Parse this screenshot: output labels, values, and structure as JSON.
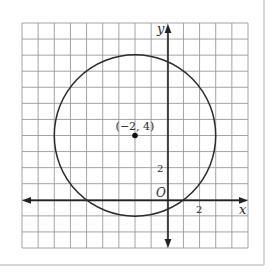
{
  "figure": {
    "grid": {
      "xmin": -9,
      "xmax": 5,
      "ymin": -3,
      "ymax": 11,
      "step": 1
    },
    "axes": {
      "x_label": "x",
      "y_label": "y",
      "origin_label": "O",
      "x_tick_label": "2",
      "y_tick_label": "2"
    },
    "circle": {
      "center_x": -2,
      "center_y": 4,
      "radius": 5
    },
    "center_point": {
      "label": "(−2, 4)"
    },
    "colors": {
      "grid": "#9a9a9a",
      "axis": "#222222",
      "curve": "#2b2b2b",
      "frame": "#c8c8c8"
    }
  }
}
